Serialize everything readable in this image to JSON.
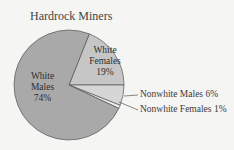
{
  "chart_data": {
    "type": "pie",
    "title": "Hardrock Miners",
    "categories": [
      "White Males",
      "White Females",
      "Nonwhite Males",
      "Nonwhite Females"
    ],
    "values": [
      74,
      19,
      6,
      1
    ],
    "unit": "%",
    "colors": [
      "#a9a9a9",
      "#c6c6c6",
      "#d6d6d6",
      "#ebebeb"
    ],
    "labels": [
      {
        "line1": "White",
        "line2": "Males",
        "line3": "74%"
      },
      {
        "line1": "White",
        "line2": "Females",
        "line3": "19%"
      },
      {
        "text": "Nonwhite Males 6%"
      },
      {
        "text": "Nonwhite Females 1%"
      }
    ],
    "legend": "none (callout labels)"
  }
}
